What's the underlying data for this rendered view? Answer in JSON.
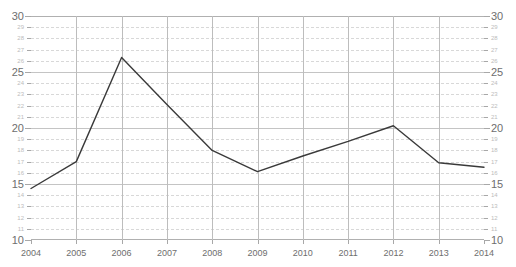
{
  "chart_data": {
    "type": "line",
    "title": "",
    "xlabel": "",
    "ylabel": "",
    "x": [
      2004,
      2005,
      2006,
      2007,
      2008,
      2009,
      2010,
      2011,
      2012,
      2013,
      2014
    ],
    "categories": [
      "2004",
      "2005",
      "2006",
      "2007",
      "2008",
      "2009",
      "2010",
      "2011",
      "2012",
      "2013",
      "2014"
    ],
    "values": [
      14.6,
      17.0,
      26.3,
      22.1,
      18.0,
      16.1,
      17.5,
      18.8,
      20.2,
      16.9,
      16.5
    ],
    "series": [
      {
        "name": "series-1",
        "color": "#3a3a3a",
        "values": [
          14.6,
          17.0,
          26.3,
          22.1,
          18.0,
          16.1,
          17.5,
          18.8,
          20.2,
          16.9,
          16.5
        ]
      }
    ],
    "xlim": [
      2004,
      2014
    ],
    "ylim": [
      10,
      30
    ],
    "y_major_ticks": [
      10,
      15,
      20,
      25,
      30
    ],
    "y_minor_ticks": [
      11,
      12,
      13,
      14,
      16,
      17,
      18,
      19,
      21,
      22,
      23,
      24,
      26,
      27,
      28,
      29
    ],
    "y_tick_labels_major": [
      "10",
      "15",
      "20",
      "25",
      "30"
    ],
    "y_tick_labels_minor": [
      "11",
      "12",
      "13",
      "14",
      "16",
      "17",
      "18",
      "19",
      "21",
      "22",
      "23",
      "24",
      "26",
      "27",
      "28",
      "29"
    ],
    "x_major_ticks": [
      2004,
      2005,
      2006,
      2007,
      2008,
      2009,
      2010,
      2011,
      2012,
      2013,
      2014
    ],
    "grid": {
      "horizontal_major": true,
      "horizontal_minor": true,
      "horizontal_minor_style": "dashed",
      "vertical_major": true
    },
    "legend": {
      "visible": false,
      "position": "none",
      "entries": []
    },
    "axes": {
      "left_axis_labels": true,
      "right_axis_labels": true,
      "mirrored_y_axis": true
    },
    "colors": {
      "line": "#3a3a3a",
      "grid_major": "#c4c4c4",
      "grid_minor": "#d8d8d8",
      "axis": "#b0b0b0",
      "tick_label_major": "#6e6e6e",
      "tick_label_minor": "#bcbcbc",
      "background": "#ffffff"
    }
  }
}
